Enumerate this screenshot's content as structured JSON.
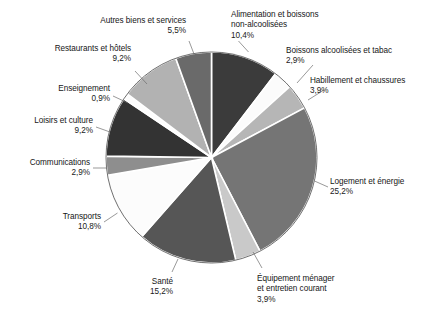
{
  "chart_data": {
    "type": "pie",
    "title": "",
    "subtitle": "",
    "xlabel": "",
    "ylabel": "",
    "legend_position": "none",
    "grid": false,
    "value_suffix": "%",
    "decimal_separator": ",",
    "start_angle_deg": 0,
    "direction": "clockwise",
    "categories": [
      "Alimentation et boissons non-alcoolisées",
      "Boissons alcoolisées et tabac",
      "Habillement et chaussures",
      "Logement et énergie",
      "Équipement ménager et entretien courant",
      "Santé",
      "Transports",
      "Communications",
      "Loisirs et culture",
      "Enseignement",
      "Restaurants et hôtels",
      "Autres biens et services"
    ],
    "values": [
      10.4,
      2.9,
      3.9,
      25.2,
      3.9,
      15.2,
      10.8,
      2.9,
      9.2,
      0.9,
      9.2,
      5.5
    ],
    "value_labels": [
      "10,4%",
      "2,9%",
      "3,9%",
      "25,2%",
      "3,9%",
      "15,2%",
      "10,8%",
      "2,9%",
      "9,2%",
      "0,9%",
      "9,2%",
      "5,5%"
    ],
    "colors": [
      "#3b3b3b",
      "#fbfbfb",
      "#b6b6b6",
      "#757575",
      "#c9c9c9",
      "#565656",
      "#fcfcfc",
      "#8e8e8e",
      "#333333",
      "#fdfdfd",
      "#b2b2b2",
      "#6a6a6a"
    ],
    "slice_stroke": "#ffffff",
    "slices": [
      {
        "name": "Alimentation et boissons non-alcoolisées",
        "value": 10.4,
        "label": "10,4%",
        "color": "#3b3b3b"
      },
      {
        "name": "Boissons alcoolisées et tabac",
        "value": 2.9,
        "label": "2,9%",
        "color": "#fbfbfb"
      },
      {
        "name": "Habillement et chaussures",
        "value": 3.9,
        "label": "3,9%",
        "color": "#b6b6b6"
      },
      {
        "name": "Logement et énergie",
        "value": 25.2,
        "label": "25,2%",
        "color": "#757575"
      },
      {
        "name": "Équipement ménager et entretien courant",
        "value": 3.9,
        "label": "3,9%",
        "color": "#c9c9c9"
      },
      {
        "name": "Santé",
        "value": 15.2,
        "label": "15,2%",
        "color": "#565656"
      },
      {
        "name": "Transports",
        "value": 10.8,
        "label": "10,8%",
        "color": "#fcfcfc"
      },
      {
        "name": "Communications",
        "value": 2.9,
        "label": "2,9%",
        "color": "#8e8e8e"
      },
      {
        "name": "Loisirs et culture",
        "value": 9.2,
        "label": "9,2%",
        "color": "#333333"
      },
      {
        "name": "Enseignement",
        "value": 0.9,
        "label": "0,9%",
        "color": "#fdfdfd"
      },
      {
        "name": "Restaurants et hôtels",
        "value": 9.2,
        "label": "9,2%",
        "color": "#b2b2b2"
      },
      {
        "name": "Autres biens et services",
        "value": 5.5,
        "label": "5,5%",
        "color": "#6a6a6a"
      }
    ]
  },
  "labels": {
    "alimentation": {
      "line1": "Alimentation et boissons",
      "line2": "non-alcoolisées",
      "pct": "10,4%"
    },
    "boissons_alcool": {
      "line1": "Boissons alcoolisées et tabac",
      "pct": "2,9%"
    },
    "habillement": {
      "line1": "Habillement et chaussures",
      "pct": "3,9%"
    },
    "logement": {
      "line1": "Logement et énergie",
      "pct": "25,2%"
    },
    "equipement": {
      "line1": "Équipement ménager",
      "line2": "et entretien courant",
      "pct": "3,9%"
    },
    "sante": {
      "line1": "Santé",
      "pct": "15,2%"
    },
    "transports": {
      "line1": "Transports",
      "pct": "10,8%"
    },
    "communications": {
      "line1": "Communications",
      "pct": "2,9%"
    },
    "loisirs": {
      "line1": "Loisirs et culture",
      "pct": "9,2%"
    },
    "enseignement": {
      "line1": "Enseignement",
      "pct": "0,9%"
    },
    "restaurants": {
      "line1": "Restaurants et hôtels",
      "pct": "9,2%"
    },
    "autres": {
      "line1": "Autres biens et services",
      "pct": "5,5%"
    }
  }
}
